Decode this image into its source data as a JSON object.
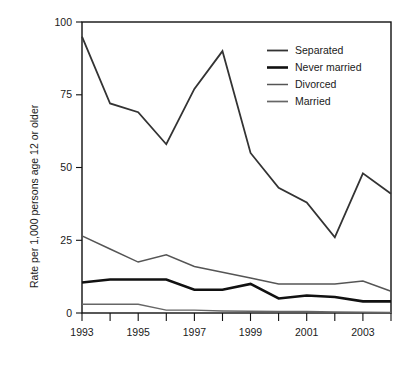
{
  "chart_data": {
    "type": "line",
    "title": "",
    "subtitle": "",
    "xlabel": "",
    "ylabel": "Rate per 1,000 persons age 12 or older",
    "x": [
      1993,
      1994,
      1995,
      1996,
      1997,
      1998,
      1999,
      2000,
      2001,
      2002,
      2003,
      2004
    ],
    "xlim": [
      1993,
      2004
    ],
    "ylim": [
      0,
      100
    ],
    "y_ticks": [
      0,
      25,
      50,
      75,
      100
    ],
    "y_tick_labels": [
      "0",
      "25",
      "50",
      "75",
      "100"
    ],
    "x_ticks": [
      1993,
      1994,
      1995,
      1996,
      1997,
      1998,
      1999,
      2000,
      2001,
      2002,
      2003,
      2004
    ],
    "x_tick_labels": [
      "1993",
      "",
      "1995",
      "",
      "1997",
      "",
      "1999",
      "",
      "2001",
      "",
      "2003",
      ""
    ],
    "grid": false,
    "legend_position": "top-right",
    "series": [
      {
        "name": "Separated",
        "color": "#333333",
        "width": 1.8,
        "values": [
          95,
          72,
          69,
          58,
          77,
          90,
          55,
          43,
          38,
          26,
          48,
          41
        ]
      },
      {
        "name": "Never married",
        "color": "#111111",
        "width": 2.6,
        "values": [
          10.5,
          11.5,
          11.5,
          11.5,
          8,
          8,
          10,
          5,
          6,
          5.5,
          4,
          4
        ]
      },
      {
        "name": "Divorced",
        "color": "#555555",
        "width": 1.5,
        "values": [
          26.5,
          22,
          17.5,
          20,
          16,
          14,
          12,
          10,
          10,
          10,
          11,
          7.5
        ]
      },
      {
        "name": "Married",
        "color": "#666666",
        "width": 1.4,
        "values": [
          3,
          3,
          3,
          1,
          1,
          0.7,
          0.6,
          0.5,
          0.5,
          0.4,
          0.3,
          0.2
        ]
      }
    ]
  },
  "legend": {
    "items": [
      {
        "label": "Separated"
      },
      {
        "label": "Never married"
      },
      {
        "label": "Divorced"
      },
      {
        "label": "Married"
      }
    ]
  },
  "axes": {
    "y_title": "Rate per 1,000 persons age 12 or older",
    "y_labels": [
      "100",
      "75",
      "50",
      "25",
      "0"
    ],
    "x_labels": [
      "1993",
      "1995",
      "1997",
      "1999",
      "2001",
      "2003"
    ]
  }
}
